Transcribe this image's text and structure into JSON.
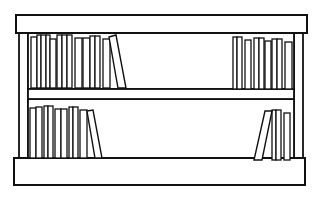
{
  "image": {
    "subject": "bookshelf-line-drawing",
    "width": 323,
    "height": 203,
    "background": "#ffffff",
    "stroke_color": "#111111",
    "fill_color": "#ffffff"
  },
  "bookshelf": {
    "top_board": {
      "x": 16,
      "y": 15,
      "w": 291,
      "h": 18
    },
    "left_post": {
      "x": 19,
      "y": 33,
      "w": 9,
      "h": 126
    },
    "right_post": {
      "x": 294,
      "y": 33,
      "w": 9,
      "h": 126
    },
    "upper_back": {
      "x": 28,
      "y": 33,
      "w": 266,
      "h": 56
    },
    "middle_shelf": {
      "x": 28,
      "y": 89,
      "w": 266,
      "h": 10
    },
    "lower_back": {
      "x": 28,
      "y": 99,
      "w": 266,
      "h": 60
    },
    "base_board": {
      "x": 14,
      "y": 158,
      "w": 291,
      "h": 27
    },
    "book_groups": [
      {
        "name": "upper-left",
        "books": [
          {
            "x": 31,
            "y": 37,
            "w": 6,
            "h": 51
          },
          {
            "x": 37,
            "y": 35,
            "w": 4,
            "h": 53
          },
          {
            "x": 41,
            "y": 35,
            "w": 5,
            "h": 53
          },
          {
            "x": 46,
            "y": 35,
            "w": 4,
            "h": 53
          },
          {
            "x": 50,
            "y": 39,
            "w": 6,
            "h": 49
          },
          {
            "x": 57,
            "y": 35,
            "w": 5,
            "h": 53
          },
          {
            "x": 62,
            "y": 35,
            "w": 5,
            "h": 53
          },
          {
            "x": 67,
            "y": 35,
            "w": 5,
            "h": 53
          },
          {
            "x": 75,
            "y": 38,
            "w": 7,
            "h": 50
          },
          {
            "x": 83,
            "y": 38,
            "w": 7,
            "h": 50
          },
          {
            "x": 90,
            "y": 36,
            "w": 5,
            "h": 52
          },
          {
            "x": 95,
            "y": 36,
            "w": 5,
            "h": 52
          },
          {
            "x": 103,
            "y": 39,
            "w": 7,
            "h": 49
          }
        ],
        "leaning": [
          {
            "points": "109,37 116,35 126,88 118,88"
          }
        ]
      },
      {
        "name": "upper-right",
        "books": [
          {
            "x": 233,
            "y": 37,
            "w": 4,
            "h": 52
          },
          {
            "x": 237,
            "y": 37,
            "w": 5,
            "h": 52
          },
          {
            "x": 245,
            "y": 40,
            "w": 6,
            "h": 49
          },
          {
            "x": 254,
            "y": 38,
            "w": 5,
            "h": 51
          },
          {
            "x": 259,
            "y": 38,
            "w": 5,
            "h": 51
          },
          {
            "x": 265,
            "y": 41,
            "w": 6,
            "h": 48
          },
          {
            "x": 272,
            "y": 39,
            "w": 5,
            "h": 50
          },
          {
            "x": 277,
            "y": 39,
            "w": 5,
            "h": 50
          },
          {
            "x": 285,
            "y": 42,
            "w": 7,
            "h": 47
          }
        ],
        "leaning": []
      },
      {
        "name": "lower-left",
        "books": [
          {
            "x": 30,
            "y": 108,
            "w": 6,
            "h": 50
          },
          {
            "x": 36,
            "y": 107,
            "w": 6,
            "h": 51
          },
          {
            "x": 44,
            "y": 106,
            "w": 4,
            "h": 52
          },
          {
            "x": 48,
            "y": 106,
            "w": 5,
            "h": 52
          },
          {
            "x": 55,
            "y": 109,
            "w": 6,
            "h": 49
          },
          {
            "x": 61,
            "y": 109,
            "w": 6,
            "h": 49
          },
          {
            "x": 69,
            "y": 107,
            "w": 4,
            "h": 51
          },
          {
            "x": 73,
            "y": 107,
            "w": 5,
            "h": 51
          },
          {
            "x": 80,
            "y": 110,
            "w": 7,
            "h": 48
          }
        ],
        "leaning": [
          {
            "points": "87,111 93,110 102,158 95,158"
          }
        ]
      },
      {
        "name": "lower-right",
        "books": [
          {
            "x": 272,
            "y": 110,
            "w": 4,
            "h": 50
          },
          {
            "x": 276,
            "y": 110,
            "w": 5,
            "h": 50
          },
          {
            "x": 284,
            "y": 113,
            "w": 6,
            "h": 47
          }
        ],
        "leaning": [
          {
            "points": "265,111 272,111 262,160 254,160"
          }
        ]
      }
    ]
  }
}
